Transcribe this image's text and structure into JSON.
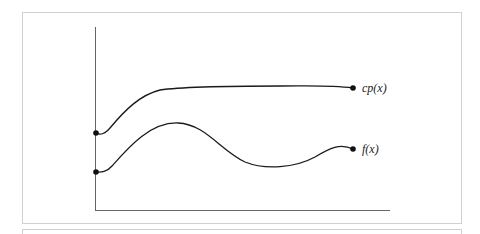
{
  "diagram": {
    "type": "function-curves",
    "axes": {
      "x_axis": true,
      "y_axis": true,
      "color": "#555555"
    },
    "curves": [
      {
        "name": "cp",
        "label": "cp(x)",
        "color": "#1a1a1a",
        "path": "M96,133 C100,135 104,135 110,128 C125,110 140,95 160,90 C180,87 230,86 280,86 C310,86 330,85 353,88"
      },
      {
        "name": "f",
        "label": "f(x)",
        "color": "#1a1a1a",
        "path": "M96,172 C100,172 106,173 112,166 C128,148 150,122 178,123 C205,124 220,150 245,162 C265,170 295,168 315,157 C330,148 340,143 353,149"
      }
    ],
    "points": [
      {
        "name": "cp-start",
        "x": 96,
        "y": 133
      },
      {
        "name": "cp-end",
        "x": 353,
        "y": 88
      },
      {
        "name": "f-start",
        "x": 96,
        "y": 172
      },
      {
        "name": "f-end",
        "x": 353,
        "y": 149
      }
    ]
  }
}
